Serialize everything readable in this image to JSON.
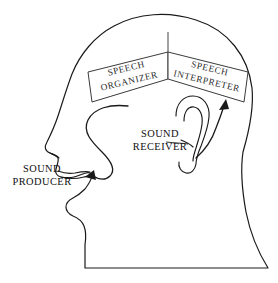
{
  "diagram": {
    "background_color": "#ffffff",
    "line_color": "#1a1a1a",
    "text_color": "#101010",
    "box_stroke_color": "#3a3a3a",
    "boxes": [
      {
        "id": "speech-organizer",
        "line1": "SPEECH",
        "line2": "ORGANIZER",
        "rotation_deg": -12,
        "position": "upper-left of cranium"
      },
      {
        "id": "speech-interpreter",
        "line1": "SPEECH",
        "line2": "INTERPRETER",
        "rotation_deg": 12,
        "position": "upper-right of cranium"
      }
    ],
    "callouts": [
      {
        "id": "sound-producer",
        "line1": "SOUND",
        "line2": "PRODUCER",
        "points_to": "mouth",
        "position": "left of face"
      },
      {
        "id": "sound-receiver",
        "line1": "SOUND",
        "line2": "RECEIVER",
        "points_to": "ear",
        "position": "left of ear"
      }
    ],
    "arrows": [
      {
        "id": "organizer-to-mouth-arrow",
        "from": "speech-organizer",
        "to": "mouth",
        "style": "curved-with-arrowhead"
      },
      {
        "id": "ear-to-interpreter-arrow",
        "from": "ear",
        "to": "speech-interpreter",
        "style": "curved-with-arrowhead"
      }
    ],
    "anatomy": [
      {
        "id": "cranium",
        "label": "cranium"
      },
      {
        "id": "forehead",
        "label": "forehead"
      },
      {
        "id": "nose",
        "label": "nose"
      },
      {
        "id": "lips",
        "label": "lips"
      },
      {
        "id": "chin",
        "label": "chin"
      },
      {
        "id": "jaw",
        "label": "jaw"
      },
      {
        "id": "neck",
        "label": "neck"
      },
      {
        "id": "ear",
        "label": "ear"
      }
    ]
  }
}
